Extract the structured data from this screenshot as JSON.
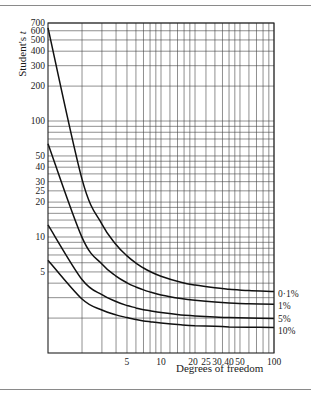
{
  "chart_data": {
    "type": "line",
    "title": "",
    "xlabel": "Degrees of freedom",
    "ylabel": "Student's t",
    "xscale": "log",
    "yscale": "log",
    "xlim": [
      1,
      100
    ],
    "ylim": [
      1,
      700
    ],
    "grid": true,
    "legend_position": "right (inline labels at curve ends)",
    "x_tick_labels": [
      "5",
      "10",
      "20",
      "25",
      "30",
      "40",
      "50",
      "100"
    ],
    "x_tick_values": [
      5,
      10,
      20,
      25,
      30,
      40,
      50,
      100
    ],
    "y_tick_labels": [
      "700",
      "600",
      "500",
      "400",
      "300",
      "200",
      "100",
      "50",
      "40",
      "30",
      "25",
      "20",
      "10",
      "5"
    ],
    "y_tick_values": [
      700,
      600,
      500,
      400,
      300,
      200,
      100,
      50,
      40,
      30,
      25,
      20,
      10,
      5
    ],
    "x_gridlines": [
      2,
      3,
      4,
      5,
      6,
      7,
      8,
      9,
      10,
      12,
      14,
      16,
      18,
      20,
      25,
      30,
      35,
      40,
      45,
      50,
      60,
      70,
      80,
      90,
      100
    ],
    "y_gridlines": [
      2,
      3,
      4,
      5,
      6,
      7,
      8,
      9,
      10,
      12,
      14,
      16,
      18,
      20,
      25,
      30,
      35,
      40,
      45,
      50,
      60,
      70,
      80,
      90,
      100,
      200,
      300,
      400,
      500,
      600,
      700
    ],
    "x": [
      1,
      2,
      3,
      4,
      5,
      6,
      7,
      8,
      10,
      15,
      20,
      30,
      40,
      60,
      100
    ],
    "series": [
      {
        "name": "0·1%",
        "values": [
          636.6,
          31.6,
          12.92,
          8.61,
          6.87,
          5.96,
          5.41,
          5.04,
          4.59,
          4.07,
          3.85,
          3.65,
          3.55,
          3.46,
          3.39
        ]
      },
      {
        "name": "1%",
        "values": [
          63.66,
          9.92,
          5.84,
          4.6,
          4.03,
          3.71,
          3.5,
          3.36,
          3.17,
          2.95,
          2.85,
          2.75,
          2.7,
          2.66,
          2.63
        ]
      },
      {
        "name": "5%",
        "values": [
          12.71,
          4.3,
          3.18,
          2.78,
          2.57,
          2.45,
          2.36,
          2.31,
          2.23,
          2.13,
          2.09,
          2.04,
          2.02,
          2.0,
          1.98
        ]
      },
      {
        "name": "10%",
        "values": [
          6.31,
          2.92,
          2.35,
          2.13,
          2.02,
          1.94,
          1.89,
          1.86,
          1.81,
          1.75,
          1.72,
          1.7,
          1.68,
          1.67,
          1.66
        ]
      }
    ]
  },
  "labels": {
    "ylabel_prefix": "Student's ",
    "ylabel_var": "t",
    "xlabel": "Degrees of freedom"
  }
}
